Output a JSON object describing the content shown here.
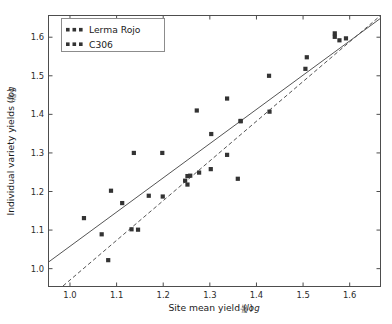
{
  "figure": {
    "background_color": "#ffffff",
    "width": 392,
    "height": 324
  },
  "chart_data": {
    "type": "scatter",
    "title": "",
    "xlabel": "Site mean yield (log kg/ha)",
    "xlabel_main": "Site mean yield (",
    "xlabel_log": "log",
    "xlabel_num": "kg",
    "xlabel_den": "ha",
    "xlabel_close": ")",
    "ylabel": "Individual variety yields (log kg/ha)",
    "ylabel_main": "Individual variety yields (",
    "ylabel_log": "log",
    "ylabel_num": "kg",
    "ylabel_den": "ha",
    "ylabel_close": ")",
    "xlim": [
      0.955,
      1.665
    ],
    "ylim": [
      0.955,
      1.655
    ],
    "xticks": [
      1.0,
      1.1,
      1.2,
      1.3,
      1.4,
      1.5,
      1.6
    ],
    "xtick_labels": [
      "1.0",
      "1.1",
      "1.2",
      "1.3",
      "1.4",
      "1.5",
      "1.6"
    ],
    "yticks": [
      1.0,
      1.1,
      1.2,
      1.3,
      1.4,
      1.5,
      1.6
    ],
    "ytick_labels": [
      "1.0",
      "1.1",
      "1.2",
      "1.3",
      "1.4",
      "1.5",
      "1.6"
    ],
    "grid": false,
    "legend_position": "upper left",
    "marker_color": "#333333",
    "line_color": "#555555",
    "series": [
      {
        "name": "Lerma Rojo",
        "marker": "square",
        "linestyle": "solid",
        "color": "#333333",
        "points": [
          [
            1.03,
            1.131
          ],
          [
            1.068,
            1.089
          ],
          [
            1.088,
            1.202
          ],
          [
            1.137,
            1.3
          ],
          [
            1.169,
            1.189
          ],
          [
            1.198,
            1.3
          ],
          [
            1.252,
            1.24
          ],
          [
            1.258,
            1.241
          ],
          [
            1.272,
            1.41
          ],
          [
            1.303,
            1.349
          ],
          [
            1.337,
            1.441
          ],
          [
            1.366,
            1.383
          ],
          [
            1.427,
            1.5
          ],
          [
            1.508,
            1.548
          ],
          [
            1.568,
            1.61
          ],
          [
            1.578,
            1.592
          ]
        ],
        "fit_line": {
          "x0": 0.955,
          "y0": 1.018,
          "x1": 1.665,
          "y1": 1.648
        }
      },
      {
        "name": "C306",
        "marker": "square",
        "linestyle": "dashed",
        "color": "#333333",
        "points": [
          [
            1.082,
            1.022
          ],
          [
            1.112,
            1.17
          ],
          [
            1.132,
            1.102
          ],
          [
            1.146,
            1.101
          ],
          [
            1.199,
            1.187
          ],
          [
            1.247,
            1.228
          ],
          [
            1.252,
            1.218
          ],
          [
            1.277,
            1.249
          ],
          [
            1.302,
            1.258
          ],
          [
            1.337,
            1.295
          ],
          [
            1.36,
            1.233
          ],
          [
            1.366,
            1.382
          ],
          [
            1.428,
            1.407
          ],
          [
            1.505,
            1.518
          ],
          [
            1.568,
            1.601
          ],
          [
            1.592,
            1.597
          ]
        ],
        "fit_line": {
          "x0": 0.985,
          "y0": 0.955,
          "x1": 1.665,
          "y1": 1.655
        }
      }
    ]
  },
  "legend": {
    "items": [
      {
        "label": "Lerma Rojo",
        "marker": "square",
        "color": "#333333"
      },
      {
        "label": "C306",
        "marker": "square",
        "color": "#333333"
      }
    ]
  }
}
